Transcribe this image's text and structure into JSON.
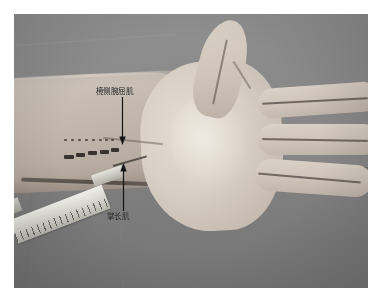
{
  "figure": {
    "kind": "anatomical-photograph",
    "palette": {
      "page_background": "#ffffff",
      "photo_field": "#8d8d8d",
      "drape_upper": "#949494",
      "drape_lower": "#7c7c7c",
      "skin_light": "#e6ded4",
      "skin_mid": "#cfc5ba",
      "skin_shadow": "#aea298",
      "annotation_ink": "#1a1a1a",
      "mark_ink": "#232320",
      "syringe_body": "#efefe9"
    }
  },
  "annotations": [
    {
      "id": "fcr",
      "label": "樈侧腕屈肌",
      "arrow": "down-arrow-icon",
      "points_to": "tendon of flexor carpi radialis at the wrist"
    },
    {
      "id": "pl",
      "label": "掌长肌",
      "arrow": "up-arrow-icon",
      "points_to": "tendon of palmaris longus at the wrist"
    }
  ],
  "markings": {
    "upper_row_label": "guide-dot-row",
    "upper_row_count": 8,
    "lower_row_label": "injection-site-block-row",
    "lower_row_count": 5
  },
  "instruments": [
    {
      "id": "syringe",
      "name": "graduated-syringe",
      "orientation": "entering from lower-left toward the wrist"
    }
  ],
  "anatomy": [
    {
      "id": "forearm",
      "name": "forearm"
    },
    {
      "id": "palm",
      "name": "palm"
    },
    {
      "id": "thumb",
      "name": "thumb"
    },
    {
      "id": "finger-index",
      "name": "index-finger"
    },
    {
      "id": "finger-middle",
      "name": "middle-finger"
    },
    {
      "id": "finger-ring",
      "name": "ring-finger"
    },
    {
      "id": "wrist-crease",
      "name": "wrist-crease"
    }
  ]
}
